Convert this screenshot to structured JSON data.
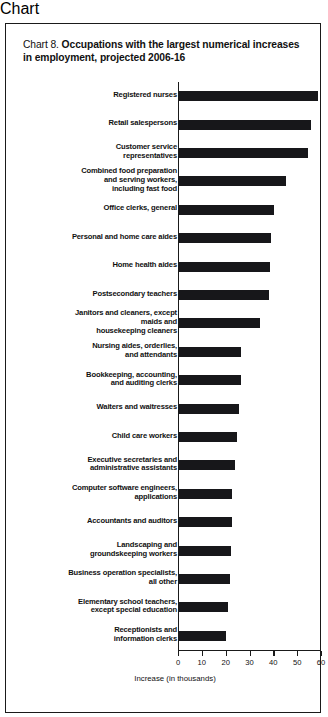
{
  "chart_data": {
    "type": "bar",
    "orientation": "horizontal",
    "title": "Chart 8. Occupations with the largest numerical increases in employment, projected 2006-16",
    "title_lead": "Chart 8.",
    "title_bold": "Occupations with the largest numerical increases in employment, projected 2006-16",
    "xlabel": "Increase (in thousands)",
    "ylabel": "",
    "xlim": [
      0,
      60
    ],
    "xticks": [
      0,
      10,
      20,
      30,
      40,
      50,
      60
    ],
    "xtick_labels": [
      "0",
      "10",
      "20",
      "30",
      "40",
      "50",
      "60"
    ],
    "grid": false,
    "legend": false,
    "bar_color": "#17171a",
    "categories": [
      "Registered nurses",
      "Retail salespersons",
      "Customer service representatives",
      "Combined food preparation and serving workers, including fast food",
      "Office clerks, general",
      "Personal and home care aides",
      "Home health aides",
      "Postsecondary teachers",
      "Janitors and cleaners, except maids and housekeeping cleaners",
      "Nursing aides, orderlies, and attendants",
      "Bookkeeping, accounting, and auditing clerks",
      "Waiters and waitresses",
      "Child care workers",
      "Executive secretaries and administrative assistants",
      "Computer software engineers, applications",
      "Accountants and auditors",
      "Landscaping and groundskeeping workers",
      "Business operation specialists, all other",
      "Elementary school teachers, except special education",
      "Receptionists and information clerks"
    ],
    "category_lines": [
      [
        "Registered nurses"
      ],
      [
        "Retail salespersons"
      ],
      [
        "Customer service",
        "representatives"
      ],
      [
        "Combined food preparation",
        "and serving workers,",
        "including fast food"
      ],
      [
        "Office clerks, general"
      ],
      [
        "Personal and home care aides"
      ],
      [
        "Home health aides"
      ],
      [
        "Postsecondary teachers"
      ],
      [
        "Janitors and cleaners, except",
        "maids and",
        "housekeeping cleaners"
      ],
      [
        "Nursing aides, orderlies,",
        "and attendants"
      ],
      [
        "Bookkeeping, accounting,",
        "and auditing clerks"
      ],
      [
        "Waiters and waitresses"
      ],
      [
        "Child care workers"
      ],
      [
        "Executive secretaries and",
        "administrative assistants"
      ],
      [
        "Computer software engineers,",
        "applications"
      ],
      [
        "Accountants and auditors"
      ],
      [
        "Landscaping and",
        "groundskeeping workers"
      ],
      [
        "Business operation specialists,",
        "all other"
      ],
      [
        "Elementary school teachers,",
        "except special education"
      ],
      [
        "Receptionists and",
        "information clerks"
      ]
    ],
    "values": [
      587,
      557,
      545,
      452,
      404,
      389,
      384,
      382,
      345,
      264,
      264,
      255,
      248,
      239,
      226,
      226,
      221,
      218,
      209,
      202
    ],
    "values_thousands": [
      58.7,
      55.7,
      54.5,
      45.2,
      40.4,
      38.9,
      38.4,
      38.2,
      34.5,
      26.4,
      26.4,
      25.5,
      24.8,
      23.9,
      22.6,
      22.6,
      22.1,
      21.8,
      20.9,
      20.2
    ]
  }
}
